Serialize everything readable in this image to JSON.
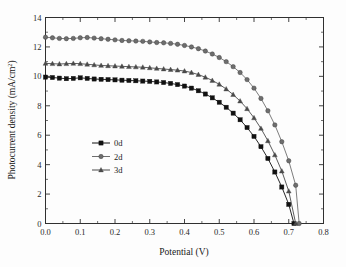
{
  "chart_data": {
    "type": "line",
    "title": "",
    "xlabel": "Potential (V)",
    "ylabel": "Photocurrent density (mA/cm2)",
    "ylabel_base": "Photocurrent density (mA/cm",
    "ylabel_sup": "2",
    "ylabel_tail": ")",
    "xlim": [
      0.0,
      0.8
    ],
    "ylim": [
      0,
      14
    ],
    "xticks": [
      0.0,
      0.1,
      0.2,
      0.3,
      0.4,
      0.5,
      0.6,
      0.7,
      0.8
    ],
    "xtick_labels": [
      "0.0",
      "0.1",
      "0.2",
      "0.3",
      "0.4",
      "0.5",
      "0.6",
      "0.7",
      "0.8"
    ],
    "yticks": [
      0,
      2,
      4,
      6,
      8,
      10,
      12,
      14
    ],
    "ytick_labels": [
      "0",
      "2",
      "4",
      "6",
      "8",
      "10",
      "12",
      "14"
    ],
    "x_minor_ticks": [
      0.05,
      0.15,
      0.25,
      0.35,
      0.45,
      0.55,
      0.65,
      0.75
    ],
    "y_minor_ticks": [
      1,
      3,
      5,
      7,
      9,
      11,
      13
    ],
    "grid": false,
    "legend_position": "center-left",
    "series": [
      {
        "name": "0d",
        "color": "#111111",
        "marker": "square",
        "x": [
          0.0,
          0.02,
          0.04,
          0.06,
          0.08,
          0.1,
          0.12,
          0.14,
          0.16,
          0.18,
          0.2,
          0.22,
          0.24,
          0.26,
          0.28,
          0.3,
          0.32,
          0.34,
          0.36,
          0.38,
          0.4,
          0.42,
          0.44,
          0.46,
          0.48,
          0.5,
          0.52,
          0.54,
          0.56,
          0.58,
          0.6,
          0.62,
          0.64,
          0.66,
          0.68,
          0.7,
          0.715
        ],
        "y": [
          9.95,
          9.92,
          9.88,
          9.84,
          9.86,
          9.9,
          9.86,
          9.82,
          9.8,
          9.78,
          9.76,
          9.74,
          9.72,
          9.7,
          9.68,
          9.66,
          9.62,
          9.58,
          9.52,
          9.44,
          9.34,
          9.2,
          9.02,
          8.8,
          8.54,
          8.24,
          7.9,
          7.5,
          7.05,
          6.52,
          5.92,
          5.22,
          4.42,
          3.5,
          2.48,
          1.3,
          0.0
        ]
      },
      {
        "name": "2d",
        "color": "#6e6e6e",
        "marker": "circle",
        "x": [
          0.0,
          0.02,
          0.04,
          0.06,
          0.08,
          0.1,
          0.12,
          0.14,
          0.16,
          0.18,
          0.2,
          0.22,
          0.24,
          0.26,
          0.28,
          0.3,
          0.32,
          0.34,
          0.36,
          0.38,
          0.4,
          0.42,
          0.44,
          0.46,
          0.48,
          0.5,
          0.52,
          0.54,
          0.56,
          0.58,
          0.6,
          0.62,
          0.64,
          0.66,
          0.68,
          0.7,
          0.72,
          0.73
        ],
        "y": [
          12.66,
          12.62,
          12.58,
          12.56,
          12.58,
          12.62,
          12.64,
          12.6,
          12.56,
          12.52,
          12.48,
          12.44,
          12.42,
          12.4,
          12.38,
          12.34,
          12.3,
          12.28,
          12.24,
          12.18,
          12.1,
          12.0,
          11.88,
          11.72,
          11.52,
          11.28,
          11.0,
          10.66,
          10.26,
          9.78,
          9.2,
          8.5,
          7.66,
          6.7,
          5.56,
          4.26,
          2.6,
          0.0
        ]
      },
      {
        "name": "3d",
        "color": "#4a4a4a",
        "marker": "triangle",
        "x": [
          0.0,
          0.02,
          0.04,
          0.06,
          0.08,
          0.1,
          0.12,
          0.14,
          0.16,
          0.18,
          0.2,
          0.22,
          0.24,
          0.26,
          0.28,
          0.3,
          0.32,
          0.34,
          0.36,
          0.38,
          0.4,
          0.42,
          0.44,
          0.46,
          0.48,
          0.5,
          0.52,
          0.54,
          0.56,
          0.58,
          0.6,
          0.62,
          0.64,
          0.66,
          0.68,
          0.7,
          0.72
        ],
        "y": [
          10.88,
          10.86,
          10.84,
          10.86,
          10.88,
          10.86,
          10.82,
          10.78,
          10.74,
          10.72,
          10.7,
          10.68,
          10.66,
          10.64,
          10.62,
          10.58,
          10.54,
          10.5,
          10.46,
          10.42,
          10.36,
          10.26,
          10.12,
          9.94,
          9.72,
          9.46,
          9.14,
          8.76,
          8.32,
          7.8,
          7.18,
          6.46,
          5.62,
          4.66,
          3.56,
          2.2,
          0.0
        ]
      }
    ],
    "legend": [
      {
        "label": "0d",
        "color": "#111111",
        "marker": "square"
      },
      {
        "label": "2d",
        "color": "#6e6e6e",
        "marker": "circle"
      },
      {
        "label": "3d",
        "color": "#4a4a4a",
        "marker": "triangle"
      }
    ]
  }
}
